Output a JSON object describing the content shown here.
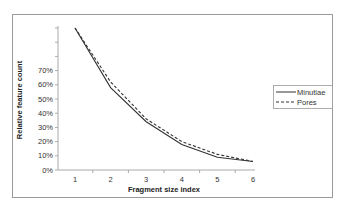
{
  "chart_data": {
    "type": "line",
    "title": "",
    "xlabel": "Fragment size index",
    "ylabel": "Relative feature count",
    "x": [
      1,
      2,
      3,
      4,
      5,
      6
    ],
    "series": [
      {
        "name": "Minutiae",
        "style": "solid",
        "values": [
          100,
          58,
          34,
          18,
          9,
          6
        ]
      },
      {
        "name": "Pores",
        "style": "dashed",
        "values": [
          100,
          62,
          36,
          20,
          11,
          6
        ]
      }
    ],
    "y_tick_labels": [
      "0%",
      "10%",
      "20%",
      "30%",
      "40%",
      "50%",
      "60%",
      "70%",
      "",
      "",
      ""
    ],
    "y_ticks": [
      0,
      10,
      20,
      30,
      40,
      50,
      60,
      70,
      80,
      90,
      100
    ],
    "x_tick_labels": [
      "1",
      "2",
      "3",
      "4",
      "5",
      "6"
    ],
    "ylim": [
      0,
      100
    ],
    "xlim": [
      0.5,
      6
    ],
    "grid": false,
    "legend_position": "right",
    "colors": {
      "line": "#333333",
      "frame": "#999999",
      "axis": "#aaaaaa"
    }
  }
}
